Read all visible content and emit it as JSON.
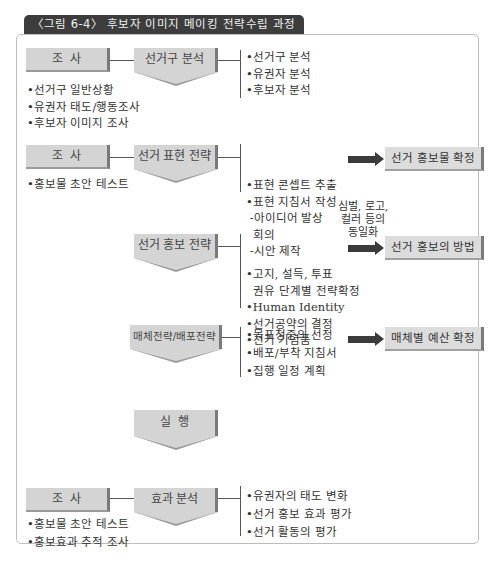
{
  "title": "〈그림 6-4〉 후보자 이미지 메이킹 전략수립 과정",
  "rows": [
    {
      "left_box": "조  사",
      "left_items": [
        "선거구 일반상황",
        "유권자 태도/행동조사",
        "후보자 이미지 조사"
      ],
      "stage": "선거구 분석",
      "items": [
        "•선거구 분석",
        "•유권자 분석",
        "•후보자 분석"
      ]
    },
    {
      "left_box": "조  사",
      "left_items": [
        "홍보물 초안 테스트"
      ],
      "stage": "선거 표현 전략",
      "items": [
        "•표현 콘셉트 추출",
        "•표현 지침서 작성",
        " -아이디어 발상",
        "  회의",
        " -시안 제작"
      ],
      "result": "선거 홍보물 확정"
    },
    {
      "stage": "선거 홍보 전략",
      "items": [
        "•고지, 설득, 투표",
        "  권유 단계별 전략확정",
        "•Human Identity",
        "•선거공약의 결정",
        "•선거 기념품"
      ],
      "arrow_note": [
        "심벌, 로고,",
        "컬러 등의",
        "동일화"
      ],
      "result": "선거 홍보의 방법"
    },
    {
      "stage": "매체전략/배포전략",
      "items": [
        "•목표청중의 선정",
        "•배포/부착 지침서",
        "•집행 일정 계획"
      ],
      "result": "매체별 예산 확정"
    },
    {
      "stage": "실  행"
    },
    {
      "left_box": "조  사",
      "left_items": [
        "홍보물 초안 테스트",
        "홍보효과 추적 조사"
      ],
      "stage": "효과 분석",
      "items": [
        "•유권자의 태도 변화",
        "•선거 홍보 효과 평가",
        "•선거 활동의 평가"
      ]
    }
  ],
  "colors": {
    "box_fill": "#d4d4d4",
    "box_shadow": "#7a7a7a",
    "title_bg": "#3d3d3d",
    "arrow": "#3b3b3b"
  }
}
